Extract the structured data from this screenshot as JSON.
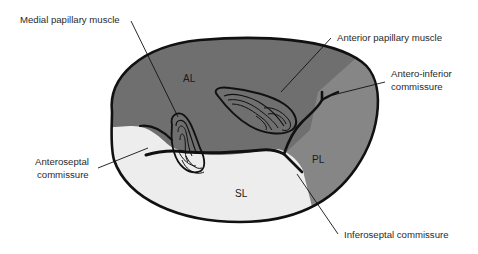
{
  "diagram": {
    "colors": {
      "anterior_leaflet": "#6f6f6f",
      "posterior_leaflet": "#868686",
      "septal_leaflet": "#ededed",
      "outline": "#111111",
      "background": "#ffffff"
    },
    "regions": {
      "al": "AL",
      "pl": "PL",
      "sl": "SL"
    },
    "labels": {
      "medial_papillary": "Medial papillary muscle",
      "anterior_papillary": "Anterior papillary muscle",
      "antero_inferior_line1": "Antero-inferior",
      "antero_inferior_line2": "commissure",
      "anteroseptal_line1": "Anteroseptal",
      "anteroseptal_line2": "commissure",
      "inferoseptal": "Inferoseptal commissure"
    }
  }
}
